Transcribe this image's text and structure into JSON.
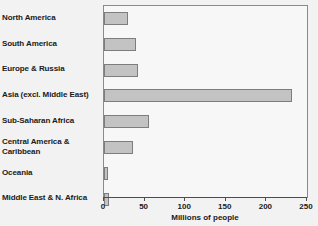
{
  "chart_data": {
    "type": "bar",
    "orientation": "horizontal",
    "title": "",
    "xlabel": "Millions of people",
    "ylabel": "",
    "xlim": [
      0,
      250
    ],
    "xticks": [
      0,
      50,
      100,
      150,
      200,
      250
    ],
    "grid": false,
    "legend": null,
    "categories": [
      "North America",
      "South America",
      "Europe & Russia",
      "Asia (excl. Middle East)",
      "Sub-Saharan Africa",
      "Central America &\nCaribbean",
      "Oceania",
      "Middle East & N. Africa"
    ],
    "values": [
      30,
      39,
      42,
      231,
      55,
      36,
      5,
      6
    ],
    "units": "Millions of people"
  },
  "style": {
    "bar_fill": "#c3c3c3",
    "bar_stroke": "#7d7d7d",
    "plot_background": "#f7f7f7",
    "page_background": "#f2f2f2",
    "axis_color": "#4d4d4d",
    "text_color": "#1a1a1a"
  }
}
